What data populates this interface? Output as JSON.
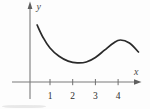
{
  "figure": {
    "xlabel": "x",
    "ylabel": "y",
    "x_tick_labels": [
      "1",
      "2",
      "3",
      "4"
    ],
    "colors": {
      "curve": "#2a2a2a",
      "axis": "#7a7a7a",
      "tick": "#6f6f6f",
      "text": "#2e2e2e",
      "background": "#fdfdfd"
    }
  },
  "chart_data": {
    "type": "line",
    "title": "",
    "xlabel": "x",
    "ylabel": "y",
    "x_ticks": [
      1,
      2,
      3,
      4
    ],
    "xlim": [
      -0.7,
      5.0
    ],
    "ylim": [
      -0.75,
      3.5
    ],
    "grid": false,
    "legend": null,
    "series": [
      {
        "name": "curve",
        "x": [
          0.43,
          0.7,
          1.0,
          1.4,
          1.8,
          2.2,
          2.6,
          3.0,
          3.4,
          3.8,
          4.1,
          4.5,
          4.9
        ],
        "y": [
          2.51,
          1.95,
          1.5,
          1.13,
          0.92,
          0.84,
          0.88,
          1.08,
          1.4,
          1.72,
          1.85,
          1.72,
          1.32
        ]
      }
    ],
    "annotations": {
      "local_min_near_x": 2.2,
      "local_max_near_x": 4.1
    }
  }
}
